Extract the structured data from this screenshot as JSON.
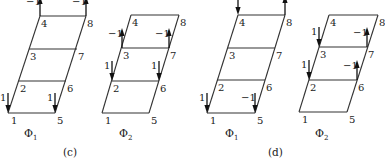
{
  "figure": {
    "panels": [
      {
        "caption": "(c)",
        "caption_pos": [
          63,
          156
        ],
        "modes": [
          {
            "name": "Φ",
            "subscript": "1",
            "label_pos": [
              24,
              137
            ],
            "rows": [
              {
                "node_left": "4",
                "node_right": "8",
                "y": 16,
                "x1": 40,
                "x2": 86
              },
              {
                "node_left": "3",
                "node_right": "7",
                "y": 49,
                "x1": 29,
                "x2": 77
              },
              {
                "node_left": "2",
                "node_right": "6",
                "y": 81,
                "x1": 19,
                "x2": 66
              },
              {
                "node_left": "1",
                "node_right": "5",
                "y": 113,
                "x1": 8,
                "x2": 55
              }
            ],
            "loads": [
              {
                "node": "4",
                "value": "−1",
                "direction": "up",
                "x": 40,
                "y": 16
              },
              {
                "node": "8",
                "value": "−1",
                "direction": "up",
                "x": 86,
                "y": 16
              },
              {
                "node": "1",
                "value": "1",
                "direction": "down",
                "x": 8,
                "y": 113
              },
              {
                "node": "5",
                "value": "1",
                "direction": "down",
                "x": 55,
                "y": 113
              }
            ]
          },
          {
            "name": "Φ",
            "subscript": "2",
            "label_pos": [
              119,
              137
            ],
            "rows": [
              {
                "node_left": "4",
                "node_right": "8",
                "y": 15,
                "x1": 131,
                "x2": 179
              },
              {
                "node_left": "3",
                "node_right": "7",
                "y": 48,
                "x1": 122,
                "x2": 169
              },
              {
                "node_left": "2",
                "node_right": "6",
                "y": 81,
                "x1": 112,
                "x2": 159
              },
              {
                "node_left": "1",
                "node_right": "5",
                "y": 113,
                "x1": 102,
                "x2": 149
              }
            ],
            "loads": [
              {
                "node": "3",
                "value": "−1",
                "direction": "up",
                "x": 122,
                "y": 48
              },
              {
                "node": "7",
                "value": "−1",
                "direction": "up",
                "x": 169,
                "y": 48
              },
              {
                "node": "2",
                "value": "1",
                "direction": "down",
                "x": 112,
                "y": 81
              },
              {
                "node": "6",
                "value": "1",
                "direction": "down",
                "x": 159,
                "y": 81
              }
            ]
          }
        ]
      },
      {
        "caption": "(d)",
        "caption_pos": [
          268,
          156
        ],
        "modes": [
          {
            "name": "Φ",
            "subscript": "1",
            "label_pos": [
              225,
              137
            ],
            "rows": [
              {
                "node_left": "4",
                "node_right": "8",
                "y": 15,
                "x1": 238,
                "x2": 285
              },
              {
                "node_left": "3",
                "node_right": "7",
                "y": 48,
                "x1": 228,
                "x2": 275
              },
              {
                "node_left": "2",
                "node_right": "6",
                "y": 80,
                "x1": 217,
                "x2": 265
              },
              {
                "node_left": "1",
                "node_right": "5",
                "y": 113,
                "x1": 207,
                "x2": 255
              }
            ],
            "loads": [
              {
                "node": "4",
                "value": "",
                "direction": "down",
                "x": 238,
                "y": 15
              },
              {
                "node": "8",
                "value": "",
                "direction": "up",
                "x": 285,
                "y": 15
              },
              {
                "node": "1",
                "value": "1",
                "direction": "down",
                "x": 207,
                "y": 113
              },
              {
                "node": "5",
                "value": "−1",
                "direction": "down",
                "x": 255,
                "y": 113
              }
            ]
          },
          {
            "name": "Φ",
            "subscript": "2",
            "label_pos": [
              315,
              137
            ],
            "rows": [
              {
                "node_left": "4",
                "node_right": "8",
                "y": 15,
                "x1": 329,
                "x2": 378
              },
              {
                "node_left": "3",
                "node_right": "7",
                "y": 47,
                "x1": 319,
                "x2": 367
              },
              {
                "node_left": "2",
                "node_right": "6",
                "y": 80,
                "x1": 309,
                "x2": 357
              },
              {
                "node_left": "1",
                "node_right": "5",
                "y": 112,
                "x1": 299,
                "x2": 347
              }
            ],
            "loads": [
              {
                "node": "3",
                "value": "1",
                "direction": "down",
                "x": 319,
                "y": 47
              },
              {
                "node": "7",
                "value": "−1",
                "direction": "up",
                "x": 367,
                "y": 47
              },
              {
                "node": "2",
                "value": "1",
                "direction": "down",
                "x": 309,
                "y": 80
              },
              {
                "node": "6",
                "value": "−1",
                "direction": "up",
                "x": 357,
                "y": 80
              }
            ]
          }
        ]
      }
    ]
  }
}
